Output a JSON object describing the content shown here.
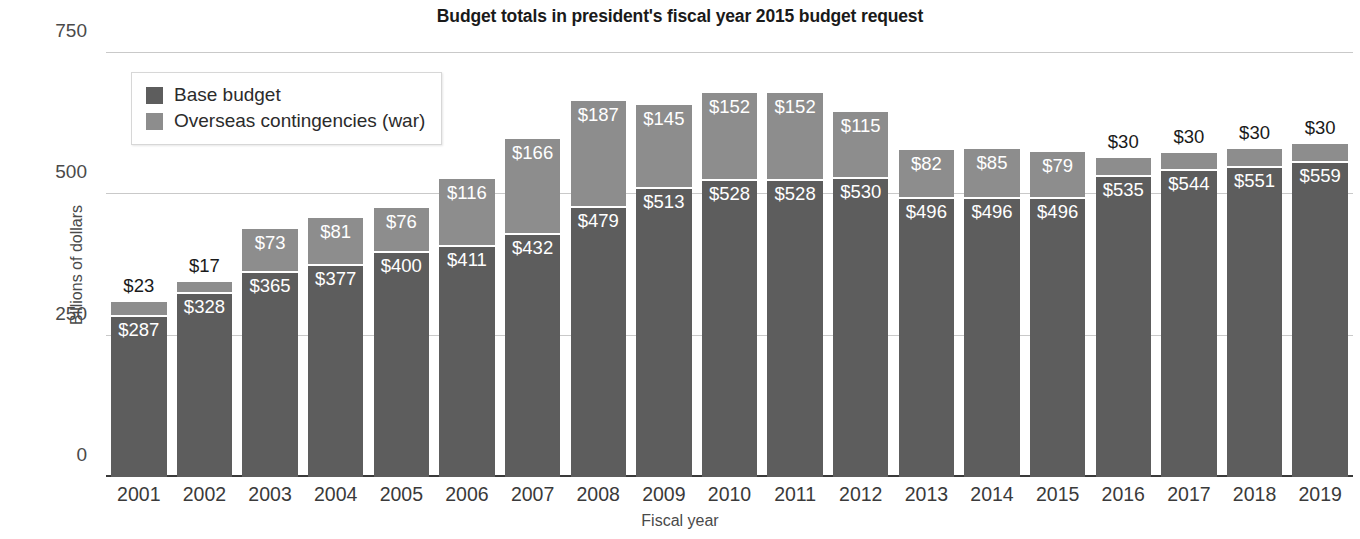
{
  "chart_data": {
    "type": "bar",
    "stacked": true,
    "title": "Budget totals in president's fiscal year 2015 budget request",
    "xlabel": "Fiscal year",
    "ylabel": "Billions of dollars",
    "ylim": [
      0,
      750
    ],
    "yticks": [
      0,
      250,
      500,
      750
    ],
    "ytick_labels": [
      "0",
      "250",
      "500",
      "750"
    ],
    "grid": true,
    "legend_position": "upper-left-inside",
    "categories": [
      "2001",
      "2002",
      "2003",
      "2004",
      "2005",
      "2006",
      "2007",
      "2008",
      "2009",
      "2010",
      "2011",
      "2012",
      "2013",
      "2014",
      "2015",
      "2016",
      "2017",
      "2018",
      "2019"
    ],
    "series": [
      {
        "name": "Base budget",
        "color": "#5d5d5d",
        "values": [
          287,
          328,
          365,
          377,
          400,
          411,
          432,
          479,
          513,
          528,
          528,
          530,
          496,
          496,
          496,
          535,
          544,
          551,
          559
        ],
        "labels": [
          "$287",
          "$328",
          "$365",
          "$377",
          "$400",
          "$411",
          "$432",
          "$479",
          "$513",
          "$528",
          "$528",
          "$530",
          "$496",
          "$496",
          "$496",
          "$535",
          "$544",
          "$551",
          "$559"
        ]
      },
      {
        "name": "Overseas contingencies (war)",
        "color": "#8d8d8d",
        "values": [
          23,
          17,
          73,
          81,
          76,
          116,
          166,
          187,
          145,
          152,
          152,
          115,
          82,
          85,
          79,
          30,
          30,
          30,
          30
        ],
        "labels": [
          "$23",
          "$17",
          "$73",
          "$81",
          "$76",
          "$116",
          "$166",
          "$187",
          "$145",
          "$152",
          "$152",
          "$115",
          "$82",
          "$85",
          "$79",
          "$30",
          "$30",
          "$30",
          "$30"
        ],
        "label_placement": [
          "outside",
          "outside",
          "inside",
          "inside",
          "inside",
          "inside",
          "inside",
          "inside",
          "inside",
          "inside",
          "inside",
          "inside",
          "inside",
          "inside",
          "inside",
          "outside",
          "outside",
          "outside",
          "outside"
        ]
      }
    ],
    "totals": [
      310,
      345,
      438,
      458,
      476,
      527,
      598,
      666,
      658,
      680,
      680,
      645,
      578,
      581,
      575,
      565,
      574,
      581,
      589
    ]
  },
  "legend": {
    "items": [
      {
        "label": "Base budget",
        "color": "#5d5d5d"
      },
      {
        "label": "Overseas contingencies (war)",
        "color": "#8d8d8d"
      }
    ]
  },
  "colors": {
    "base": "#5d5d5d",
    "war": "#8d8d8d",
    "gridline": "#c9c9c9",
    "axis": "#3a3a3a",
    "background": "#ffffff",
    "text": "#231f20"
  }
}
